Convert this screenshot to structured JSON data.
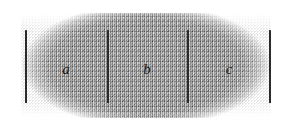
{
  "figure": {
    "kind": "interval-partition-diagram",
    "band": {
      "fill_color": "#969696",
      "texture": "stippled-hatch",
      "left": 21,
      "top": 13,
      "width": 250,
      "height": 105
    },
    "tick_color": "#2b2b2b",
    "ticks": [
      {
        "name": "left-endpoint-tick",
        "x": 25,
        "top": 30,
        "height": 73
      },
      {
        "name": "first-divider-tick",
        "x": 107,
        "top": 30,
        "height": 73
      },
      {
        "name": "second-divider-tick",
        "x": 187,
        "top": 30,
        "height": 73
      },
      {
        "name": "right-endpoint-tick",
        "x": 269,
        "top": 30,
        "height": 73
      }
    ],
    "segments": [
      {
        "label": "a",
        "center_x": 66,
        "center_y": 69
      },
      {
        "label": "b",
        "center_x": 147,
        "center_y": 69
      },
      {
        "label": "c",
        "center_x": 229,
        "center_y": 69
      }
    ]
  }
}
